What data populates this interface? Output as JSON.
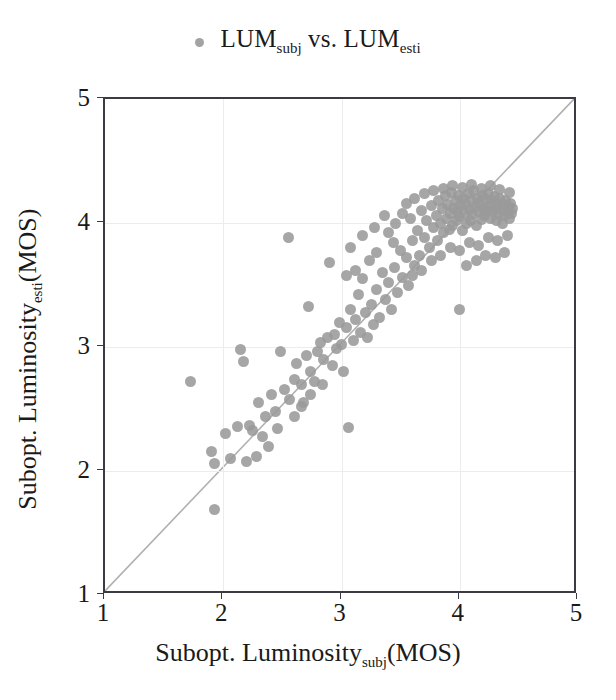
{
  "legend": {
    "marker_icon": "dot-marker",
    "text_main_1": "LUM",
    "text_sub_1": "subj",
    "text_mid": " vs. ",
    "text_main_2": "LUM",
    "text_sub_2": "esti",
    "full_text": "LUM subj vs. LUM esti"
  },
  "axes": {
    "x_title_main": "Subopt. Luminosity",
    "x_title_sub": "subj",
    "x_title_tail": "(MOS)",
    "y_title_main": "Subopt. Luminosity",
    "y_title_sub": "esti",
    "y_title_tail": "(MOS)",
    "xticks": [
      "1",
      "2",
      "3",
      "4",
      "5"
    ],
    "yticks": [
      "1",
      "2",
      "3",
      "4",
      "5"
    ]
  },
  "colors": {
    "marker": "#9a9a9a",
    "axis": "#3b3b42",
    "grid": "#ececec",
    "identity_line": "#b0b0b0",
    "background": "#ffffff"
  },
  "chart_data": {
    "type": "scatter",
    "xlabel": "Subopt. Luminosity subj (MOS)",
    "ylabel": "Subopt. Luminosity esti (MOS)",
    "xlim": [
      1,
      5
    ],
    "ylim": [
      1,
      5
    ],
    "xticks": [
      1,
      2,
      3,
      4,
      5
    ],
    "yticks": [
      1,
      2,
      3,
      4,
      5
    ],
    "grid": true,
    "legend_position": "top-center",
    "annotations": [
      {
        "type": "line",
        "name": "identity",
        "from": [
          1,
          1
        ],
        "to": [
          5,
          5
        ]
      }
    ],
    "series": [
      {
        "name": "LUM subj vs. LUM esti",
        "marker": "circle",
        "color": "#9a9a9a",
        "points": [
          [
            1.72,
            2.72
          ],
          [
            1.93,
            1.69
          ],
          [
            1.9,
            2.16
          ],
          [
            1.93,
            2.06
          ],
          [
            2.02,
            2.3
          ],
          [
            2.06,
            2.1
          ],
          [
            2.12,
            2.36
          ],
          [
            2.15,
            2.98
          ],
          [
            2.17,
            2.88
          ],
          [
            2.22,
            2.37
          ],
          [
            2.25,
            2.33
          ],
          [
            2.3,
            2.55
          ],
          [
            2.33,
            2.28
          ],
          [
            2.36,
            2.44
          ],
          [
            2.41,
            2.62
          ],
          [
            2.44,
            2.48
          ],
          [
            2.46,
            2.34
          ],
          [
            2.52,
            2.66
          ],
          [
            2.55,
            3.88
          ],
          [
            2.56,
            2.58
          ],
          [
            2.6,
            2.74
          ],
          [
            2.62,
            2.87
          ],
          [
            2.66,
            2.7
          ],
          [
            2.68,
            2.55
          ],
          [
            2.7,
            2.93
          ],
          [
            2.72,
            3.33
          ],
          [
            2.74,
            2.8
          ],
          [
            2.77,
            2.72
          ],
          [
            2.8,
            2.96
          ],
          [
            2.82,
            3.04
          ],
          [
            2.85,
            2.9
          ],
          [
            2.88,
            3.08
          ],
          [
            2.9,
            3.68
          ],
          [
            2.92,
            2.85
          ],
          [
            2.94,
            3.1
          ],
          [
            2.96,
            2.99
          ],
          [
            2.98,
            3.2
          ],
          [
            3.0,
            3.02
          ],
          [
            3.02,
            2.8
          ],
          [
            3.04,
            3.16
          ],
          [
            3.06,
            2.35
          ],
          [
            3.08,
            3.3
          ],
          [
            3.1,
            3.05
          ],
          [
            3.12,
            3.22
          ],
          [
            3.14,
            3.42
          ],
          [
            3.16,
            3.12
          ],
          [
            3.18,
            3.55
          ],
          [
            3.2,
            3.28
          ],
          [
            3.22,
            3.08
          ],
          [
            3.25,
            3.34
          ],
          [
            3.27,
            3.18
          ],
          [
            3.3,
            3.46
          ],
          [
            3.32,
            3.24
          ],
          [
            3.35,
            3.6
          ],
          [
            3.37,
            3.38
          ],
          [
            3.4,
            3.52
          ],
          [
            3.42,
            3.3
          ],
          [
            3.45,
            3.64
          ],
          [
            3.47,
            3.44
          ],
          [
            3.5,
            3.78
          ],
          [
            3.52,
            3.56
          ],
          [
            3.55,
            3.72
          ],
          [
            3.57,
            3.5
          ],
          [
            3.58,
            4.04
          ],
          [
            3.6,
            3.86
          ],
          [
            3.62,
            3.66
          ],
          [
            3.64,
            3.94
          ],
          [
            3.66,
            3.74
          ],
          [
            3.68,
            4.1
          ],
          [
            3.7,
            3.88
          ],
          [
            3.72,
            4.02
          ],
          [
            3.74,
            3.8
          ],
          [
            3.76,
            4.14
          ],
          [
            3.78,
            3.96
          ],
          [
            3.8,
            4.06
          ],
          [
            3.81,
            3.86
          ],
          [
            3.82,
            4.18
          ],
          [
            3.84,
            4.0
          ],
          [
            3.85,
            4.12
          ],
          [
            3.86,
            3.92
          ],
          [
            3.88,
            4.22
          ],
          [
            3.89,
            4.04
          ],
          [
            3.9,
            4.15
          ],
          [
            3.91,
            3.95
          ],
          [
            3.92,
            4.08
          ],
          [
            3.93,
            4.25
          ],
          [
            3.94,
            3.98
          ],
          [
            3.95,
            4.12
          ],
          [
            3.96,
            4.18
          ],
          [
            3.97,
            4.02
          ],
          [
            3.98,
            4.1
          ],
          [
            3.99,
            4.22
          ],
          [
            4.0,
            3.3
          ],
          [
            4.0,
            4.05
          ],
          [
            4.01,
            4.14
          ],
          [
            4.02,
            3.94
          ],
          [
            4.03,
            4.2
          ],
          [
            4.04,
            4.08
          ],
          [
            4.05,
            4.16
          ],
          [
            4.06,
            4.0
          ],
          [
            4.07,
            4.24
          ],
          [
            4.08,
            4.11
          ],
          [
            4.09,
            4.02
          ],
          [
            4.1,
            4.18
          ],
          [
            4.11,
            4.07
          ],
          [
            4.12,
            4.26
          ],
          [
            4.13,
            4.13
          ],
          [
            4.14,
            3.98
          ],
          [
            4.15,
            4.2
          ],
          [
            4.16,
            4.09
          ],
          [
            4.17,
            4.16
          ],
          [
            4.18,
            4.03
          ],
          [
            4.19,
            4.22
          ],
          [
            4.2,
            4.12
          ],
          [
            4.21,
            4.06
          ],
          [
            4.22,
            4.19
          ],
          [
            4.23,
            4.1
          ],
          [
            4.24,
            4.24
          ],
          [
            4.25,
            4.14
          ],
          [
            4.26,
            4.04
          ],
          [
            4.27,
            4.18
          ],
          [
            4.28,
            4.09
          ],
          [
            4.29,
            4.21
          ],
          [
            4.3,
            4.12
          ],
          [
            4.31,
            4.02
          ],
          [
            4.32,
            4.16
          ],
          [
            4.33,
            4.07
          ],
          [
            4.34,
            4.2
          ],
          [
            4.35,
            4.11
          ],
          [
            4.36,
            4.0
          ],
          [
            4.37,
            4.15
          ],
          [
            4.38,
            4.06
          ],
          [
            4.39,
            4.18
          ],
          [
            4.4,
            4.09
          ],
          [
            4.41,
            4.13
          ],
          [
            4.42,
            4.04
          ],
          [
            4.43,
            4.16
          ],
          [
            4.44,
            4.08
          ],
          [
            4.45,
            4.12
          ],
          [
            3.55,
            4.16
          ],
          [
            3.62,
            4.2
          ],
          [
            3.7,
            4.24
          ],
          [
            3.78,
            4.26
          ],
          [
            3.86,
            4.28
          ],
          [
            3.94,
            4.3
          ],
          [
            4.02,
            4.29
          ],
          [
            4.1,
            4.31
          ],
          [
            4.18,
            4.28
          ],
          [
            4.26,
            4.3
          ],
          [
            4.34,
            4.27
          ],
          [
            4.42,
            4.25
          ],
          [
            3.52,
            4.08
          ],
          [
            3.46,
            4.0
          ],
          [
            3.4,
            3.92
          ],
          [
            3.36,
            4.06
          ],
          [
            3.44,
            3.84
          ],
          [
            3.3,
            3.76
          ],
          [
            3.28,
            3.96
          ],
          [
            3.24,
            3.7
          ],
          [
            3.18,
            3.9
          ],
          [
            3.12,
            3.62
          ],
          [
            3.08,
            3.8
          ],
          [
            3.04,
            3.58
          ],
          [
            3.84,
            3.74
          ],
          [
            3.92,
            3.8
          ],
          [
            4.0,
            3.78
          ],
          [
            4.08,
            3.84
          ],
          [
            4.16,
            3.82
          ],
          [
            4.24,
            3.88
          ],
          [
            4.32,
            3.86
          ],
          [
            4.4,
            3.9
          ],
          [
            3.76,
            3.7
          ],
          [
            3.68,
            3.62
          ],
          [
            3.6,
            3.58
          ],
          [
            4.06,
            3.66
          ],
          [
            4.14,
            3.7
          ],
          [
            4.22,
            3.74
          ],
          [
            4.3,
            3.72
          ],
          [
            4.38,
            3.76
          ],
          [
            2.48,
            2.96
          ],
          [
            2.38,
            2.2
          ],
          [
            2.28,
            2.12
          ],
          [
            2.2,
            2.08
          ],
          [
            2.6,
            2.44
          ],
          [
            2.66,
            2.52
          ],
          [
            2.74,
            2.62
          ],
          [
            2.84,
            2.7
          ]
        ]
      }
    ]
  }
}
